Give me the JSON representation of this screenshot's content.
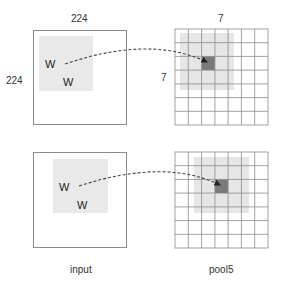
{
  "top": {
    "input_width_label": "224",
    "input_height_label": "224",
    "w1": "W",
    "w2": "W",
    "grid_width_label": "7",
    "grid_height_label": "7"
  },
  "bottom": {
    "w1": "W",
    "w2": "W"
  },
  "captions": {
    "input": "input",
    "pool5": "pool5"
  },
  "grid": {
    "rows": 7,
    "cols": 7
  },
  "colors": {
    "patch": "#e9e9e9",
    "grid_patch": "#dcdcdc",
    "active_cell": "#7a7a7a",
    "grid_line": "#8a8a8a",
    "arrow": "#333333"
  }
}
